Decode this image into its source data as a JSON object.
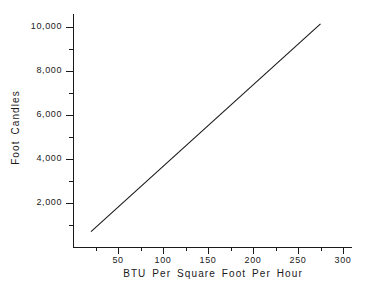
{
  "chart_data": {
    "type": "line",
    "title": "",
    "xlabel": "BTU Per Square Foot Per Hour",
    "ylabel": "Foot Candles",
    "xlim": [
      0,
      310
    ],
    "ylim": [
      0,
      10600
    ],
    "grid": false,
    "legend": null,
    "x_major_ticks": [
      50,
      100,
      150,
      200,
      250,
      300
    ],
    "x_major_tick_labels": [
      "50",
      "100",
      "150",
      "200",
      "250",
      "300"
    ],
    "x_minor_ticks": [
      25,
      75,
      125,
      175,
      225,
      275
    ],
    "y_major_ticks": [
      2000,
      4000,
      6000,
      8000,
      10000
    ],
    "y_major_tick_labels": [
      "2,000",
      "4,000",
      "6,000",
      "8,000",
      "10,000"
    ],
    "y_minor_ticks": [
      1000,
      3000,
      5000,
      7000,
      9000
    ],
    "series": [
      {
        "name": "Illumination vs Heat Load",
        "color": "#1a1a1a",
        "x": [
          20,
          275
        ],
        "y": [
          700,
          10150
        ]
      }
    ]
  },
  "axes": {
    "x_title": "BTU Per Square Foot Per Hour",
    "y_title": "Foot Candles"
  }
}
